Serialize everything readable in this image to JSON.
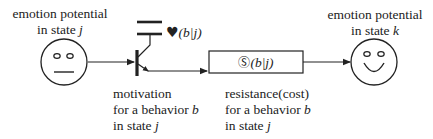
{
  "diagram": {
    "left_state": {
      "title_line1": "emotion potential",
      "title_line2_prefix": "in state ",
      "title_line2_var": "j",
      "face": "neutral-face"
    },
    "right_state": {
      "title_line1": "emotion potential",
      "title_line2_prefix": "in state ",
      "title_line2_var": "k",
      "face": "smiling-face"
    },
    "transistor": {
      "label_symbol": "♥",
      "label_args": "(b|j)",
      "caption_line1": "motivation",
      "caption_line2_prefix": "for a behavior ",
      "caption_line2_var": "b",
      "caption_line3_prefix": "in state ",
      "caption_line3_var": "j"
    },
    "resistor": {
      "label_symbol": "Ⓢ",
      "label_args": "(b|j)",
      "caption_line1": "resistance(cost)",
      "caption_line2_prefix": "for a behavior ",
      "caption_line2_var": "b",
      "caption_line3_prefix": "in state ",
      "caption_line3_var": "j"
    },
    "colors": {
      "stroke": "#222222",
      "background": "#ffffff"
    }
  }
}
